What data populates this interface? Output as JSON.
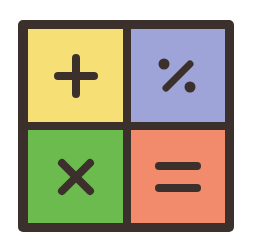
{
  "icon": {
    "name": "calculator-operators-icon",
    "frame_color": "#3b302b",
    "glyph_color": "#3b302b",
    "tiles": [
      {
        "position": "top-left",
        "symbol": "plus",
        "glyph": "+",
        "color": "#f6df74"
      },
      {
        "position": "top-right",
        "symbol": "percent",
        "glyph": "%",
        "color": "#9ea3d8"
      },
      {
        "position": "bottom-left",
        "symbol": "times",
        "glyph": "×",
        "color": "#6cbb4f"
      },
      {
        "position": "bottom-right",
        "symbol": "equals",
        "glyph": "=",
        "color": "#f28a6c"
      }
    ]
  }
}
